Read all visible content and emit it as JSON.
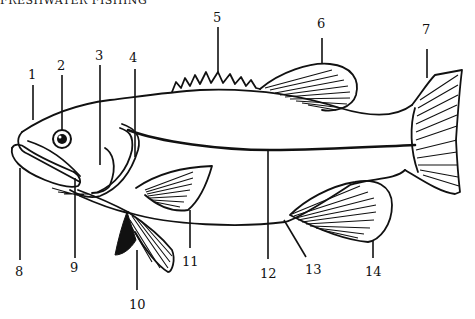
{
  "header": {
    "text": "FRESHWATER FISHING"
  },
  "diagram": {
    "labels": [
      {
        "n": "1"
      },
      {
        "n": "2"
      },
      {
        "n": "3"
      },
      {
        "n": "4"
      },
      {
        "n": "5"
      },
      {
        "n": "6"
      },
      {
        "n": "7"
      },
      {
        "n": "8"
      },
      {
        "n": "9"
      },
      {
        "n": "10"
      },
      {
        "n": "11"
      },
      {
        "n": "12"
      },
      {
        "n": "13"
      },
      {
        "n": "14"
      }
    ]
  }
}
